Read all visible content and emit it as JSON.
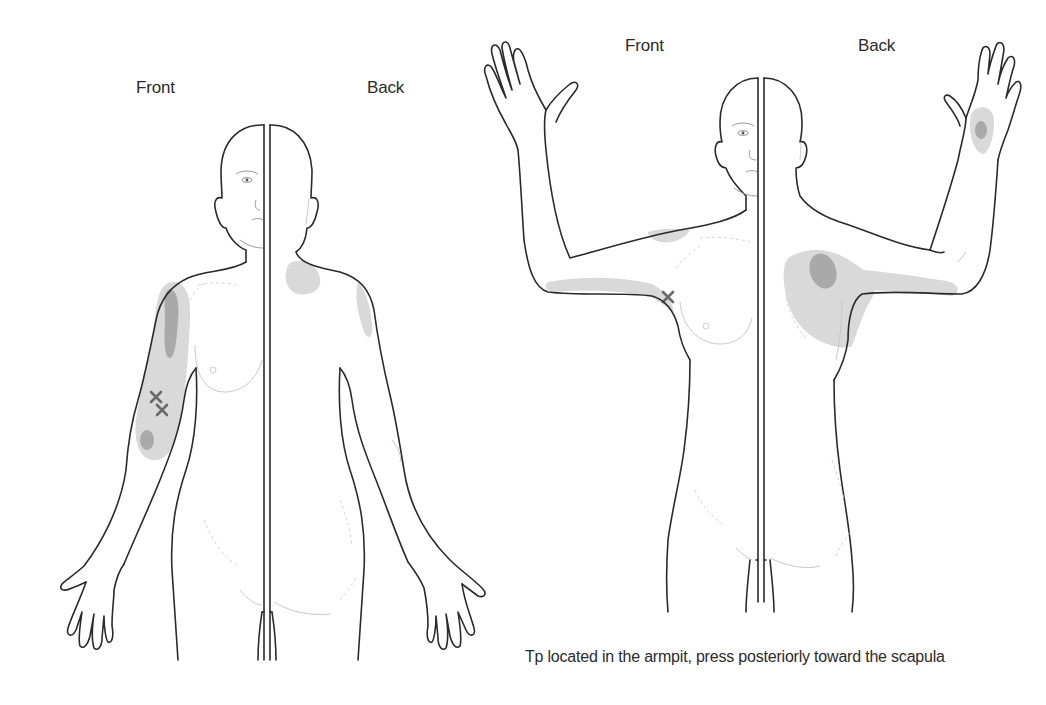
{
  "figure_left": {
    "label_front": "Front",
    "label_back": "Back",
    "pose": "arms-down",
    "trigger_point_count": 2
  },
  "figure_right": {
    "label_front": "Front",
    "label_back": "Back",
    "pose": "arms-raised",
    "trigger_point_count": 1,
    "caption": "Tp located in the armpit, press posteriorly toward the scapula"
  },
  "colors": {
    "outline": "#2a2a2a",
    "referred_pain_zone": "#d9d9d9",
    "primary_pain_zone": "#a9a9a9",
    "trigger_point_marker": "#6a6a6a",
    "background": "#ffffff"
  },
  "legend_semantics": {
    "light_gray_area": "referred pain zone",
    "dark_gray_area": "primary pain zone",
    "x_marker": "trigger point"
  }
}
